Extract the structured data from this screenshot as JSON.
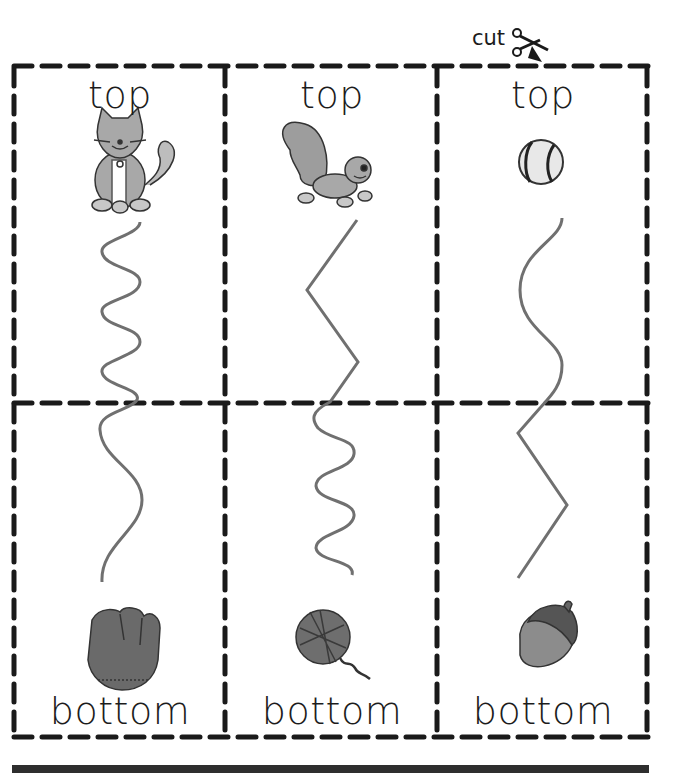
{
  "worksheet": {
    "cut_marker": {
      "label": "cut",
      "icon": "scissors-icon"
    },
    "columns": [
      {
        "top_label": "top",
        "top_picture": "cat-icon",
        "path_top_style": "tight-wave",
        "path_bottom_style": "wide-wave",
        "bottom_label": "bottom",
        "bottom_picture": "baseball-glove-icon"
      },
      {
        "top_label": "top",
        "top_picture": "squirrel-icon",
        "path_top_style": "zigzag",
        "path_bottom_style": "tight-wave",
        "bottom_label": "bottom",
        "bottom_picture": "yarn-ball-icon"
      },
      {
        "top_label": "top",
        "top_picture": "baseball-icon",
        "path_top_style": "wide-wave",
        "path_bottom_style": "zigzag",
        "bottom_label": "bottom",
        "bottom_picture": "acorn-icon"
      }
    ],
    "colors": {
      "ink": "#1c1c1c",
      "dash": "#1a1a1a",
      "trace_line": "#707070",
      "picture_gray": "#9a9a9a",
      "picture_dark": "#555555"
    }
  }
}
